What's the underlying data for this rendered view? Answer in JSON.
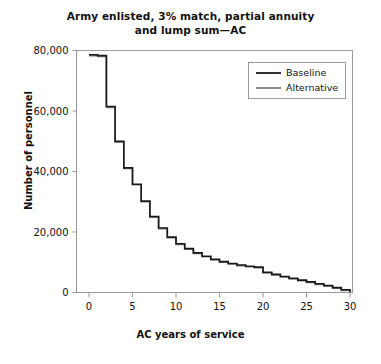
{
  "chart_data": {
    "type": "line",
    "title": "Army enlisted, 3% match, partial annuity and lump sum—AC",
    "title_line1": "Army enlisted, 3% match, partial annuity",
    "title_line2": "and lump sum—AC",
    "xlabel": "AC years of service",
    "ylabel": "Number of personnel",
    "xlim": [
      0,
      30
    ],
    "ylim": [
      0,
      80000
    ],
    "xticks": [
      0,
      5,
      10,
      15,
      20,
      25,
      30
    ],
    "xticklabels": [
      "0",
      "5",
      "10",
      "15",
      "20",
      "25",
      "30"
    ],
    "yticks": [
      0,
      20000,
      40000,
      60000,
      80000
    ],
    "yticklabels": [
      "0",
      "20,000",
      "40,000",
      "60,000",
      "80,000"
    ],
    "grid": false,
    "legend_position": "upper right",
    "drawstyle": "steps-post",
    "x": [
      0,
      1,
      2,
      3,
      4,
      5,
      6,
      7,
      8,
      9,
      10,
      11,
      12,
      13,
      14,
      15,
      16,
      17,
      18,
      19,
      20,
      21,
      22,
      23,
      24,
      25,
      26,
      27,
      28,
      29,
      30
    ],
    "series": [
      {
        "name": "Baseline",
        "color": "#1a1a1a",
        "values": [
          78600,
          78300,
          61500,
          50000,
          41200,
          35800,
          30200,
          25100,
          21300,
          18300,
          16100,
          14500,
          13100,
          12000,
          11000,
          10200,
          9600,
          9100,
          8700,
          8400,
          6700,
          6000,
          5300,
          4700,
          4100,
          3500,
          2900,
          2300,
          1600,
          900,
          200
        ]
      },
      {
        "name": "Alternative",
        "color": "#7d7d7d",
        "values": [
          78300,
          78000,
          61200,
          49700,
          41000,
          35600,
          30000,
          24900,
          21100,
          18100,
          15900,
          14300,
          12900,
          11800,
          10800,
          10000,
          9400,
          8900,
          8500,
          8200,
          6500,
          5800,
          5100,
          4500,
          3900,
          3300,
          2700,
          2100,
          1400,
          700,
          100
        ]
      }
    ]
  },
  "legend": {
    "items": [
      {
        "label": "Baseline"
      },
      {
        "label": "Alternative"
      }
    ]
  }
}
